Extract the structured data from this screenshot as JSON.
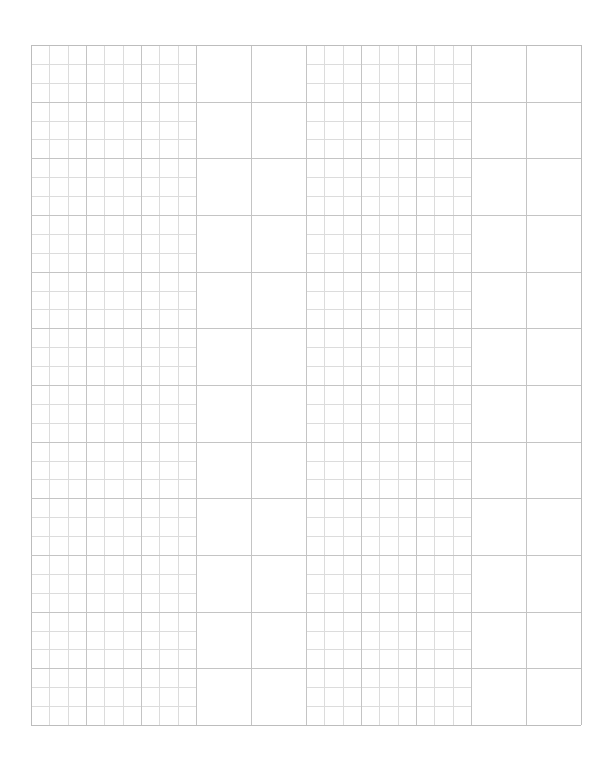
{
  "page": {
    "width": 610,
    "height": 763,
    "background": "#ffffff"
  },
  "grid": {
    "left": 31,
    "top": 45,
    "right": 581,
    "bottom": 725,
    "major_columns": 10,
    "major_rows": 12,
    "subdivisions": 3,
    "fine_column_blocks": [
      [
        0,
        2
      ],
      [
        5,
        7
      ]
    ],
    "large_column_blocks": [
      [
        3,
        4
      ],
      [
        8,
        9
      ]
    ],
    "major_line_color": "#c4c4c4",
    "minor_line_color": "#dcdcdc",
    "border_color": "#bdbdbd"
  }
}
